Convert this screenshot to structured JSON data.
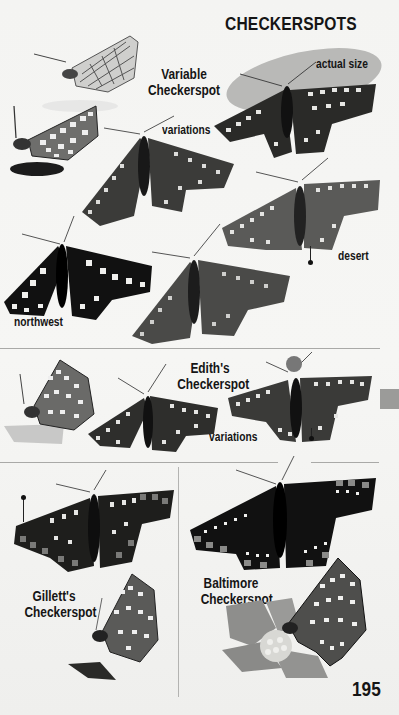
{
  "page": {
    "title": "CHECKERSPOTS",
    "page_number": "195",
    "actual_size_label": "actual size"
  },
  "sections": [
    {
      "species": "Variable Checkerspot",
      "species_line1": "Variable",
      "species_line2": "Checkerspot",
      "labels": {
        "variations": "variations",
        "desert": "desert",
        "northwest": "northwest"
      }
    },
    {
      "species": "Edith's Checkerspot",
      "species_line1": "Edith's",
      "species_line2": "Checkerspot",
      "labels": {
        "variations": "variations"
      }
    },
    {
      "species": "Gillett's Checkerspot",
      "species_line1": "Gillett's",
      "species_line2": "Checkerspot"
    },
    {
      "species": "Baltimore Checkerspot",
      "species_line1": "Baltimore",
      "species_line2": "Checkerspot"
    }
  ],
  "colors": {
    "text": "#151515",
    "background": "#f3f3f1",
    "shadow": "#b9b9b7",
    "thumb_tab": "#9b9b99",
    "rule": "#a9a9a7"
  }
}
